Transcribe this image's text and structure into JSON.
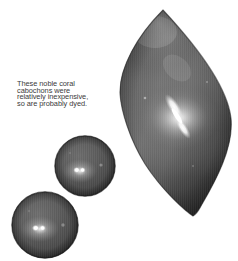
{
  "image": {
    "kind": "photograph",
    "subject": "coral cabochons",
    "background_color": "#ffffff",
    "palette": {
      "gem_body_dark": "#2f2f2f",
      "gem_body_mid": "#555555",
      "gem_body_light": "#7c7c7c",
      "gem_highlight": "#f2f2f2",
      "gem_edge_shadow": "#1f1f1f",
      "caption_color": "#3a3a3a"
    }
  },
  "caption": {
    "text": "These noble coral\ncabochons were\nrelatively inexpensive,\nso are probably dyed.",
    "lines": [
      "These noble coral",
      "cabochons were",
      "relatively inexpensive,",
      "so are probably dyed."
    ]
  },
  "objects": [
    {
      "id": "marquise",
      "label": "marquise cabochon",
      "shape": "marquise",
      "position": {
        "x": 119,
        "y": 6,
        "width": 116,
        "height": 214
      },
      "highlight": "diagonal twin streak near center"
    },
    {
      "id": "sphere-mid",
      "label": "round cabochon (middle)",
      "shape": "sphere",
      "position": {
        "x": 54,
        "y": 135,
        "width": 62,
        "height": 62
      },
      "highlight": "twin point highlight left of center"
    },
    {
      "id": "sphere-low",
      "label": "round cabochon (lower left)",
      "shape": "sphere",
      "position": {
        "x": 11,
        "y": 191,
        "width": 68,
        "height": 68
      },
      "highlight": "twin point highlight left of center"
    }
  ]
}
